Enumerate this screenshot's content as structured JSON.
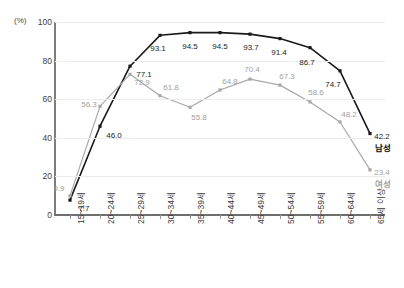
{
  "chart_data": {
    "type": "line",
    "title": "",
    "xlabel": "",
    "ylabel": "(%)",
    "ylim": [
      0,
      100
    ],
    "yticks": [
      0,
      20,
      40,
      60,
      80,
      100
    ],
    "grid": true,
    "legend_position": "inline-end-of-line",
    "categories": [
      "15~19세",
      "20~24세",
      "25~29세",
      "30~34세",
      "35~39세",
      "40~44세",
      "45~49세",
      "50~54세",
      "55~59세",
      "60~64세",
      "65세 이상"
    ],
    "series": [
      {
        "name": "남성",
        "color": "#1a1a1a",
        "marker": "square",
        "values": [
          7.7,
          46.0,
          77.1,
          93.1,
          94.5,
          94.5,
          93.7,
          91.4,
          86.7,
          74.7,
          42.2
        ],
        "labels": [
          "7.7",
          "46.0",
          "77.1",
          "93.1",
          "94.5",
          "94.5",
          "93.7",
          "91.4",
          "86.7",
          "74.7",
          "42.2"
        ]
      },
      {
        "name": "여성",
        "color": "#a8a8a8",
        "marker": "square",
        "values": [
          9.9,
          56.3,
          72.9,
          61.8,
          55.8,
          64.8,
          70.4,
          67.3,
          58.6,
          48.2,
          23.4
        ],
        "labels": [
          "9.9",
          "56.3",
          "72.9",
          "61.8",
          "55.8",
          "64.8",
          "70.4",
          "67.3",
          "58.6",
          "48.2",
          "23.4"
        ]
      }
    ]
  },
  "axis": {
    "unit_label": "(%)",
    "ytick_labels": [
      "100",
      "80",
      "60",
      "40",
      "20",
      "0"
    ]
  },
  "colors": {
    "male_line": "#1a1a1a",
    "female_line": "#a8a8a8",
    "gridline": "#ececec",
    "axis": "#6f6f6f",
    "background": "#ffffff"
  }
}
